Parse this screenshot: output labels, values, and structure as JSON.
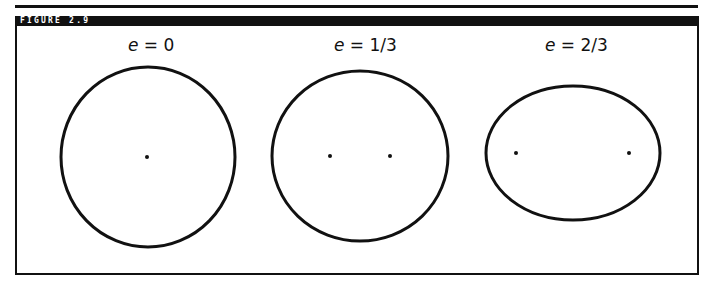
{
  "figure": {
    "label": "FIGURE 2.9",
    "stroke_color": "#111111",
    "panels": [
      {
        "var": "e",
        "eq": " = 0",
        "eccentricity": 0,
        "center": [
          148,
          157
        ],
        "rx": 87,
        "ry": 90,
        "foci": [
          [
            147,
            157
          ]
        ]
      },
      {
        "var": "e",
        "eq": " = 1/3",
        "eccentricity": 0.333,
        "center": [
          360,
          156
        ],
        "rx": 88,
        "ry": 85,
        "foci": [
          [
            330,
            156
          ],
          [
            390,
            156
          ]
        ]
      },
      {
        "var": "e",
        "eq": " = 2/3",
        "eccentricity": 0.667,
        "center": [
          573,
          153
        ],
        "rx": 87,
        "ry": 67,
        "foci": [
          [
            516,
            153
          ],
          [
            629,
            153
          ]
        ]
      }
    ]
  }
}
